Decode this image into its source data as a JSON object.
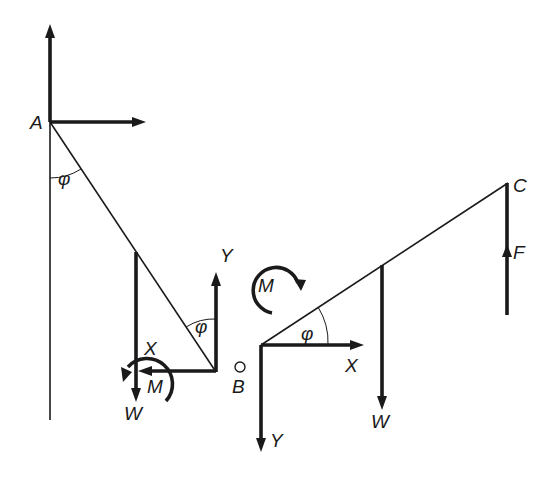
{
  "figure": {
    "left_panel": {
      "labels": {
        "A": "A",
        "phi_top": "φ",
        "phi_bottom": "φ",
        "X": "X",
        "Y": "Y",
        "M": "M",
        "W": "W",
        "B": "B"
      }
    },
    "right_panel": {
      "labels": {
        "C": "C",
        "F": "F",
        "M": "M",
        "phi": "φ",
        "X": "X",
        "Y": "Y",
        "W": "W",
        "B": "B"
      }
    }
  }
}
